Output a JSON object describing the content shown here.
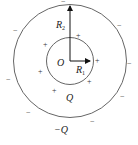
{
  "diagram": {
    "center_label": "O",
    "inner_radius_label": "R",
    "inner_radius_sub": "1",
    "outer_radius_label": "R",
    "outer_radius_sub": "2",
    "inner_charge_label": "Q",
    "outer_charge_label": "−Q",
    "plus_sign": "+",
    "minus_sign": "−",
    "colors": {
      "stroke": "#555555",
      "text": "#222222"
    }
  }
}
